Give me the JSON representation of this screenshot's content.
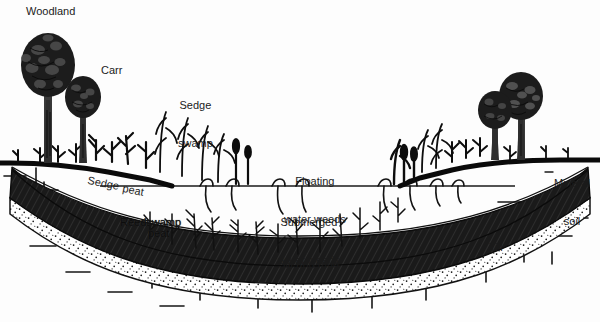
{
  "diagram": {
    "background_color": "#fdfdfd",
    "ink_color": "#111111",
    "peat_color": "#1d1d1d",
    "silt_color": "#ffffff"
  },
  "labels": {
    "woodland": "Woodland",
    "carr": "Carr",
    "sedge_swamp": "Sedge\nswamp",
    "floating_water_weeds": "Floating\nwater weeds",
    "submerged_water_weeds": "Submerged\nwater weeds",
    "mineral_soil": "Mineral\nsoil",
    "sedge_peat_a": "Sedge",
    "sedge_peat_b": "peat",
    "reedswamp_peat_a": "Reedswamp",
    "reedswamp_peat_b": "peat",
    "silt_and_mud": "Silt and mud",
    "till": "Till"
  },
  "zones": [
    {
      "name": "Woodland",
      "position": "left margin",
      "kind": "terrestrial"
    },
    {
      "name": "Carr",
      "position": "left bank",
      "kind": "scrub wetland"
    },
    {
      "name": "Sedge swamp",
      "position": "left shore",
      "kind": "emergent"
    },
    {
      "name": "Floating water weeds",
      "position": "open water surface",
      "kind": "aquatic"
    },
    {
      "name": "Submerged water weeds",
      "position": "below water surface",
      "kind": "aquatic"
    },
    {
      "name": "Mineral soil",
      "position": "right margin",
      "kind": "terrestrial"
    }
  ],
  "strata": [
    {
      "name": "Sedge peat",
      "fill": "white",
      "order": 1
    },
    {
      "name": "Reedswamp peat",
      "fill": "dark hatched",
      "order": 2
    },
    {
      "name": "Silt and mud",
      "fill": "stippled",
      "order": 3
    },
    {
      "name": "Till",
      "fill": "tick-marked",
      "order": 4
    }
  ]
}
